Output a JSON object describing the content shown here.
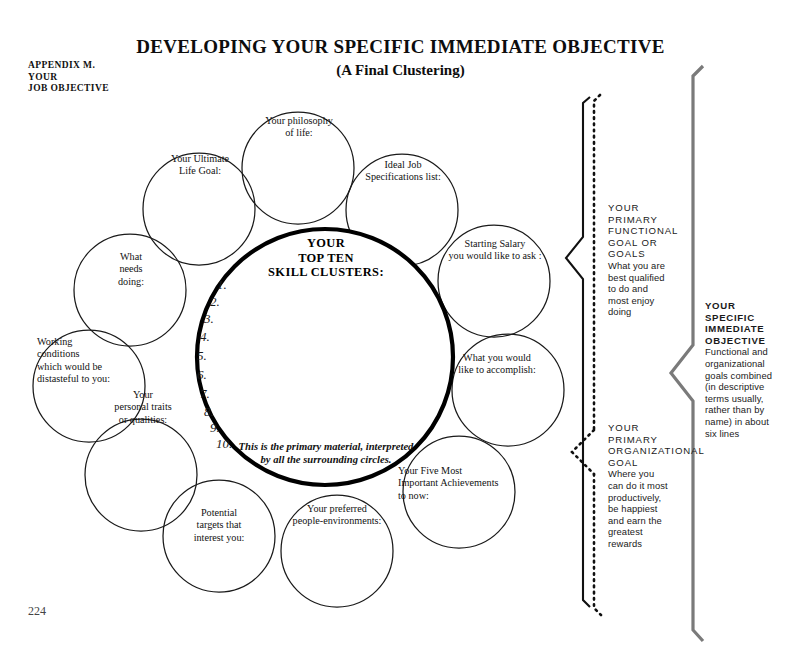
{
  "header": {
    "appendix_label": "APPENDIX M.\nYOUR\nJOB OBJECTIVE",
    "title": "DEVELOPING YOUR SPECIFIC IMMEDIATE OBJECTIVE",
    "subtitle": "(A Final Clustering)",
    "page_number": "224"
  },
  "center": {
    "heading": "YOUR\nTOP TEN\nSKILL CLUSTERS:",
    "footnote": "This is the primary material, interpreted\nby all the surrounding circles.",
    "numbers": [
      "1.",
      "2.",
      "3.",
      "4.",
      "5.",
      "6.",
      "7.",
      "8.",
      "9.",
      "10."
    ]
  },
  "circles": [
    {
      "id": "philosophy",
      "label": "Your philosophy\nof life:"
    },
    {
      "id": "ultimate-life-goal",
      "label": "Your Ultimate\nLife Goal:"
    },
    {
      "id": "ideal-job-specs",
      "label": "Ideal Job\nSpecifications list:"
    },
    {
      "id": "what-needs-doing",
      "label": "What\nneeds\ndoing:"
    },
    {
      "id": "starting-salary",
      "label": "Starting Salary\nyou would like to ask :"
    },
    {
      "id": "working-conditions",
      "label": "Working\nconditions\nwhich would be\ndistasteful to you:"
    },
    {
      "id": "accomplish",
      "label": "What you would\nlike to accomplish:"
    },
    {
      "id": "personal-traits",
      "label": "Your\npersonal traits\nor qualities:"
    },
    {
      "id": "achievements",
      "label": "Your Five Most\nImportant Achievements\nto now:"
    },
    {
      "id": "potential-targets",
      "label": "Potential\ntargets that\ninterest you:"
    },
    {
      "id": "people-environments",
      "label": "Your preferred\npeople-environments:"
    }
  ],
  "annotations": {
    "functional_goal": {
      "head": "YOUR\nPRIMARY\nFUNCTIONAL\nGOAL OR\nGOALS",
      "body": "What you are\nbest qualified\nto do and\nmost enjoy\ndoing"
    },
    "organizational_goal": {
      "head": "YOUR\nPRIMARY\nORGANIZATIONAL\nGOAL",
      "body": "Where you\ncan do it most\nproductively,\nbe happiest\nand earn the\ngreatest\nrewards"
    },
    "specific_immediate_objective": {
      "head": "YOUR\nSPECIFIC\nIMMEDIATE\nOBJECTIVE",
      "body": "Functional and\norganizational\ngoals combined\n(in descriptive\nterms usually,\nrather than by\nname) in about\nsix lines"
    }
  },
  "colors": {
    "ink": "#111111",
    "center_stroke": "#000000",
    "circle_stroke": "#1a1a1a",
    "brace_gray": "#7a7a7a",
    "paper": "#ffffff"
  }
}
